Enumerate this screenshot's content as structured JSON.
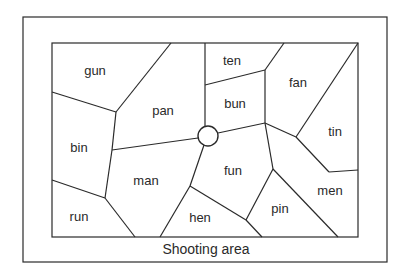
{
  "diagram": {
    "caption": "Shooting area",
    "colors": {
      "line": "#2a2a2a",
      "background": "#ffffff"
    },
    "regions": [
      {
        "word": "gun",
        "x": 95,
        "y": 70
      },
      {
        "word": "pan",
        "x": 163,
        "y": 110
      },
      {
        "word": "ten",
        "x": 232,
        "y": 60
      },
      {
        "word": "bun",
        "x": 235,
        "y": 103
      },
      {
        "word": "fan",
        "x": 298,
        "y": 82
      },
      {
        "word": "tin",
        "x": 335,
        "y": 131
      },
      {
        "word": "bin",
        "x": 79,
        "y": 147
      },
      {
        "word": "man",
        "x": 146,
        "y": 180
      },
      {
        "word": "fun",
        "x": 233,
        "y": 170
      },
      {
        "word": "men",
        "x": 330,
        "y": 190
      },
      {
        "word": "run",
        "x": 79,
        "y": 216
      },
      {
        "word": "hen",
        "x": 200,
        "y": 217
      },
      {
        "word": "pin",
        "x": 280,
        "y": 208
      }
    ],
    "target": {
      "name": "center-circle",
      "cx": 208,
      "cy": 136,
      "r": 10
    }
  }
}
